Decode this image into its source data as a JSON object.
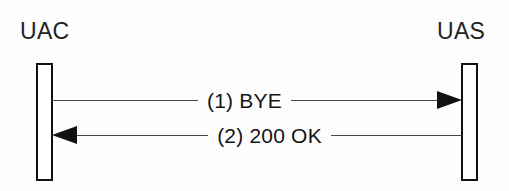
{
  "diagram": {
    "type": "sequence-diagram",
    "background_color": "#fdfdfd",
    "line_color": "#4a4a4a",
    "stroke_color": "#111111",
    "text_color": "#151515",
    "endpoints": [
      {
        "id": "uac",
        "label": "UAC",
        "side": "left"
      },
      {
        "id": "uas",
        "label": "UAS",
        "side": "right"
      }
    ],
    "messages": [
      {
        "step": "1",
        "text": "(1) BYE",
        "from": "uac",
        "to": "uas",
        "direction": "right",
        "arrowhead": "filled-triangle"
      },
      {
        "step": "2",
        "text": "(2) 200 OK",
        "from": "uas",
        "to": "uac",
        "direction": "left",
        "arrowhead": "filled-triangle"
      }
    ]
  }
}
